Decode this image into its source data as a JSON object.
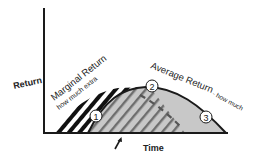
{
  "diagram": {
    "y_axis_label": "Return",
    "x_axis_label": "Time",
    "marginal_label": "Marginal Return",
    "marginal_sublabel": "how much extra",
    "average_label": "Average Return",
    "average_sublabel": "- how much",
    "markers": [
      {
        "id": "1",
        "label": "1"
      },
      {
        "id": "2",
        "label": "2"
      },
      {
        "id": "3",
        "label": "3"
      }
    ],
    "colors": {
      "axis": "#1a1a1a",
      "curve": "#1a1a1a",
      "average_fill": "#c8c8c8",
      "stripe": "#111111",
      "marker_fill": "#ffffff"
    }
  }
}
